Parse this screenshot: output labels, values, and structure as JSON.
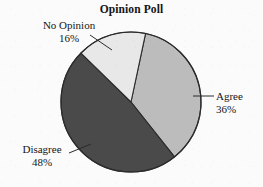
{
  "chart_data": {
    "type": "pie",
    "title": "Opinion Poll",
    "xlabel": "",
    "ylabel": "",
    "legend": "none",
    "grid": false,
    "units": "percent",
    "total": 100,
    "categories": [
      "Agree",
      "Disagree",
      "No Opinion"
    ],
    "values": [
      36,
      48,
      16
    ],
    "slices": [
      {
        "label": "Agree",
        "value": 36,
        "value_text": "36%",
        "color": "#bcbcbc",
        "start_angle_deg": 12,
        "end_angle_deg": 141.6,
        "label_position": "right"
      },
      {
        "label": "Disagree",
        "value": 48,
        "value_text": "48%",
        "color": "#4a4a4a",
        "start_angle_deg": 141.6,
        "end_angle_deg": 314.4,
        "label_position": "bottom-left"
      },
      {
        "label": "No Opinion",
        "value": 16,
        "value_text": "16%",
        "color": "#e8e8e8",
        "start_angle_deg": 314.4,
        "end_angle_deg": 372,
        "label_position": "top-left"
      }
    ]
  },
  "chart": {
    "title": "Opinion Poll",
    "outline_color": "#2b2b2b",
    "background_color": "#fbfbfb",
    "center_x": 131,
    "center_y": 102,
    "radius": 70
  },
  "labels": {
    "no_opinion": {
      "name": "No Opinion",
      "percent": "16%"
    },
    "agree": {
      "name": "Agree",
      "percent": "36%"
    },
    "disagree": {
      "name": "Disagree",
      "percent": "48%"
    }
  }
}
